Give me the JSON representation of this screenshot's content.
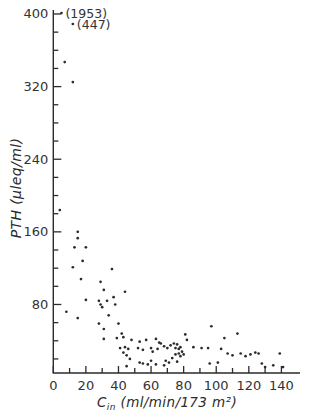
{
  "chart_data": {
    "type": "scatter",
    "title": "",
    "xlabel": {
      "symbol": "C",
      "subscript": "in",
      "units": "(ml/min/173 m²)"
    },
    "ylabel": "PTH (µleq/ml)",
    "xlim": [
      0,
      140
    ],
    "ylim": [
      0,
      400
    ],
    "x_tick_labels": [
      0,
      20,
      40,
      60,
      80,
      100,
      120,
      140
    ],
    "x_minor_tick_step": 10,
    "y_tick_labels": [
      80,
      160,
      240,
      320,
      400
    ],
    "y_minor_tick_step": 20,
    "grid": false,
    "legend": false,
    "ink_color": "#2b2b2b",
    "background_color": "#ffffff",
    "offscale_points": [
      {
        "cin": 5,
        "pth": 1953,
        "label": "(1953)"
      },
      {
        "cin": 12,
        "pth": 447,
        "label": "(447)"
      }
    ],
    "points": [
      [
        7,
        347
      ],
      [
        12,
        325
      ],
      [
        4,
        184
      ],
      [
        15,
        160
      ],
      [
        15,
        153
      ],
      [
        13,
        143
      ],
      [
        20,
        143
      ],
      [
        18,
        128
      ],
      [
        12,
        121
      ],
      [
        36,
        119
      ],
      [
        17,
        108
      ],
      [
        29,
        105
      ],
      [
        31,
        96
      ],
      [
        44,
        94
      ],
      [
        37,
        88
      ],
      [
        20,
        85
      ],
      [
        28,
        84
      ],
      [
        33,
        84
      ],
      [
        29,
        80
      ],
      [
        30,
        77
      ],
      [
        38,
        80
      ],
      [
        8,
        72
      ],
      [
        15,
        65
      ],
      [
        34,
        68
      ],
      [
        28,
        59
      ],
      [
        40,
        59
      ],
      [
        31,
        53
      ],
      [
        42,
        48
      ],
      [
        31,
        42
      ],
      [
        39,
        43
      ],
      [
        43,
        44
      ],
      [
        48,
        41
      ],
      [
        53,
        39
      ],
      [
        57,
        41
      ],
      [
        63,
        42
      ],
      [
        65,
        38
      ],
      [
        41,
        32
      ],
      [
        44,
        33
      ],
      [
        46,
        31
      ],
      [
        43,
        27
      ],
      [
        52,
        32
      ],
      [
        55,
        30
      ],
      [
        60,
        32
      ],
      [
        61,
        28
      ],
      [
        64,
        31
      ],
      [
        45,
        24
      ],
      [
        47,
        20
      ],
      [
        53,
        16
      ],
      [
        55,
        15
      ],
      [
        58,
        14
      ],
      [
        60,
        18
      ],
      [
        63,
        14
      ],
      [
        69,
        18
      ],
      [
        45,
        12
      ],
      [
        66,
        37
      ],
      [
        68,
        34
      ],
      [
        70,
        32
      ],
      [
        72,
        35
      ],
      [
        74,
        37
      ],
      [
        76,
        36
      ],
      [
        75,
        32
      ],
      [
        77,
        31
      ],
      [
        78,
        33
      ],
      [
        79,
        28
      ],
      [
        77,
        26
      ],
      [
        75,
        25
      ],
      [
        78,
        23
      ],
      [
        80,
        25
      ],
      [
        73,
        21
      ],
      [
        76,
        17
      ],
      [
        71,
        16
      ],
      [
        68,
        13
      ],
      [
        81,
        47
      ],
      [
        82,
        41
      ],
      [
        86,
        33
      ],
      [
        91,
        32
      ],
      [
        95,
        32
      ],
      [
        97,
        56
      ],
      [
        103,
        31
      ],
      [
        105,
        43
      ],
      [
        113,
        48
      ],
      [
        101,
        16
      ],
      [
        96,
        15
      ],
      [
        107,
        26
      ],
      [
        110,
        24
      ],
      [
        115,
        26
      ],
      [
        118,
        23
      ],
      [
        121,
        25
      ],
      [
        124,
        27
      ],
      [
        126,
        26
      ],
      [
        139,
        26
      ],
      [
        128,
        15
      ],
      [
        130,
        11
      ],
      [
        135,
        13
      ],
      [
        141,
        11
      ]
    ]
  }
}
